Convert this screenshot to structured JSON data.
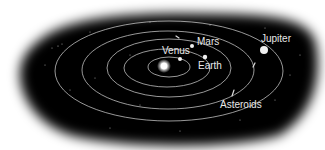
{
  "diagram": {
    "background": "#000000",
    "orbit_color": "#d8d8d8",
    "sun": {
      "name": "Sun",
      "x": 164,
      "y": 66
    },
    "orbits": [
      {
        "name": "orbit-1",
        "cx": 169,
        "cy": 67,
        "rx": 21,
        "ry": 10
      },
      {
        "name": "orbit-2",
        "cx": 167,
        "cy": 68,
        "rx": 43,
        "ry": 19
      },
      {
        "name": "orbit-3",
        "cx": 169,
        "cy": 68,
        "rx": 62,
        "ry": 29
      },
      {
        "name": "orbit-asteroid",
        "cx": 168,
        "cy": 70,
        "rx": 86,
        "ry": 39
      },
      {
        "name": "orbit-jupiter",
        "cx": 169,
        "cy": 71,
        "rx": 114,
        "ry": 50
      }
    ],
    "planets": [
      {
        "name": "Venus",
        "label": "Venus",
        "x": 180,
        "y": 59,
        "r": 2,
        "label_x": 162,
        "label_y": 46
      },
      {
        "name": "Earth",
        "label": "Earth",
        "x": 205,
        "y": 57,
        "r": 2.2,
        "label_x": 198,
        "label_y": 61
      },
      {
        "name": "Mars",
        "label": "Mars",
        "x": 192,
        "y": 46,
        "r": 2,
        "label_x": 197,
        "label_y": 37
      },
      {
        "name": "Jupiter",
        "label": "Jupiter",
        "x": 264,
        "y": 50,
        "r": 4,
        "label_x": 261,
        "label_y": 34
      }
    ],
    "asteroids_label": {
      "text": "Asteroids",
      "x": 220,
      "y": 100
    }
  }
}
